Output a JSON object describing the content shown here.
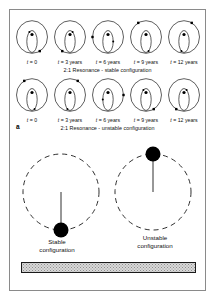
{
  "figure": {
    "panels": [
      {
        "letter": "a",
        "rows": [
          {
            "id": "stable",
            "caption": "2:1 Resonance - stable configuration",
            "time_labels": [
              {
                "var": "t",
                "eq": " = 0"
              },
              {
                "var": "t",
                "eq": " = 3 years"
              },
              {
                "var": "t",
                "eq": " = 6 years"
              },
              {
                "var": "t",
                "eq": " = 9 years"
              },
              {
                "var": "t",
                "eq": " = 12 years"
              }
            ],
            "marker_positions_deg": [
              300,
              240,
              180,
              120,
              60
            ]
          },
          {
            "id": "unstable",
            "caption": "2:1 Resonance - unstable configuration",
            "time_labels": [
              {
                "var": "t",
                "eq": " = 0"
              },
              {
                "var": "t",
                "eq": " = 3 years"
              },
              {
                "var": "t",
                "eq": " = 6 years"
              },
              {
                "var": "t",
                "eq": " = 9 years"
              },
              {
                "var": "t",
                "eq": " = 12 years"
              }
            ],
            "marker_positions_deg": [
              120,
              60,
              0,
              300,
              240
            ]
          }
        ]
      },
      {
        "letter": "b",
        "configurations": [
          {
            "id": "stable",
            "label_line1": "Stable",
            "label_line2": "configuration",
            "body_position": "bottom"
          },
          {
            "id": "unstable",
            "label_line1": "Unstable",
            "label_line2": "configuration",
            "body_position": "top"
          }
        ]
      }
    ],
    "colors": {
      "stroke": "#1a1a1a",
      "body_fill": "#000000",
      "frame": "#8a8a8a",
      "bar_fill": "#d9d9d9",
      "bar_stipple": "#8f8f8f"
    }
  }
}
